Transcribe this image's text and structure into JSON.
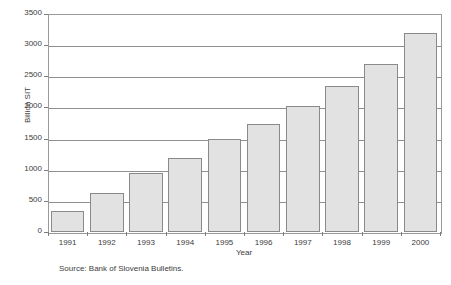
{
  "chart_data": {
    "type": "bar",
    "title": "",
    "subtitle": "",
    "xlabel": "Year",
    "ylabel": "Billion SIT",
    "categories": [
      "1991",
      "1992",
      "1993",
      "1994",
      "1995",
      "1996",
      "1997",
      "1998",
      "1999",
      "2000"
    ],
    "values": [
      340,
      630,
      940,
      1190,
      1500,
      1740,
      2030,
      2350,
      2700,
      3200
    ],
    "series": [
      {
        "name": "Billion SIT",
        "values": [
          340,
          630,
          940,
          1190,
          1500,
          1740,
          2030,
          2350,
          2700,
          3200
        ]
      }
    ],
    "ylim": [
      0,
      3500
    ],
    "ytick_values": [
      0,
      500,
      1000,
      1500,
      2000,
      2500,
      3000,
      3500
    ],
    "ytick_labels": [
      "0",
      "500",
      "1000",
      "1500",
      "2000",
      "2500",
      "3000",
      "3500"
    ],
    "grid": true,
    "grid_axis": "y",
    "legend": false,
    "legend_position": "none",
    "bar_fill_color": "#e2e2e2",
    "bar_border_color": "#8a8a8a",
    "axis_color": "#8f8f8f",
    "text_color": "#3c3c3c"
  },
  "notes": {
    "source": "Source: Bank of Slovenia Bulletins."
  }
}
